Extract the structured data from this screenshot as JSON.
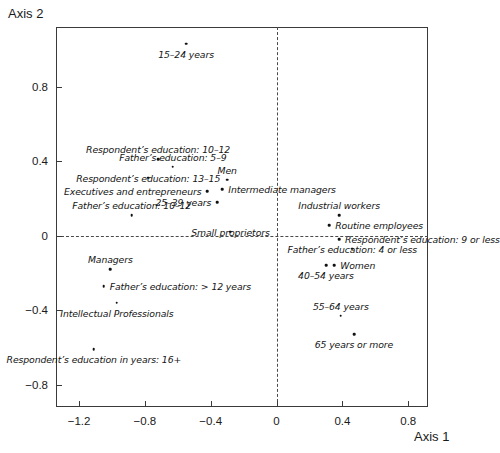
{
  "chart_data": {
    "type": "scatter",
    "title": "",
    "xlabel": "Axis 1",
    "ylabel": "Axis 2",
    "xlim": [
      -1.34,
      0.92
    ],
    "ylim": [
      -0.92,
      1.12
    ],
    "grid": false,
    "legend": "none",
    "zero_lines": true,
    "xticks": [
      -1.2,
      -0.8,
      -0.4,
      0,
      0.4,
      0.8
    ],
    "xticklabels": [
      "−1.2",
      "−0.8",
      "−0.4",
      "0",
      "0.4",
      "0.8"
    ],
    "yticks": [
      0.8,
      0.4,
      0,
      -0.4,
      -0.8
    ],
    "yticklabels": [
      "0.8",
      "0.4",
      "0",
      "−0.4",
      "−0.8"
    ],
    "points": [
      {
        "label": "15–24 years",
        "x": -0.55,
        "y": 1.03,
        "label_pos": "below",
        "label_anchor": "middle"
      },
      {
        "label": "Respondent’s education: 10–12",
        "x": -0.72,
        "y": 0.41,
        "label_pos": "above",
        "label_anchor": "middle"
      },
      {
        "label": "Father’s education: 5–9",
        "x": -0.63,
        "y": 0.37,
        "label_pos": "above",
        "label_anchor": "middle"
      },
      {
        "label": "Respondent’s education: 13–15",
        "x": -0.78,
        "y": 0.31,
        "label_pos": "center",
        "label_anchor": "middle"
      },
      {
        "label": "Men",
        "x": -0.3,
        "y": 0.3,
        "label_pos": "above",
        "label_anchor": "middle"
      },
      {
        "label": "Intermediate managers",
        "x": -0.33,
        "y": 0.25,
        "label_pos": "right",
        "label_anchor": "start"
      },
      {
        "label": "Executives and entrepreneurs",
        "x": -0.42,
        "y": 0.24,
        "label_pos": "left",
        "label_anchor": "end"
      },
      {
        "label": "25–39 years",
        "x": -0.36,
        "y": 0.18,
        "label_pos": "left",
        "label_anchor": "end"
      },
      {
        "label": "Father’s education: 10–12",
        "x": -0.88,
        "y": 0.11,
        "label_pos": "above",
        "label_anchor": "middle"
      },
      {
        "label": "Small proprietors",
        "x": -0.28,
        "y": 0.02,
        "label_pos": "center",
        "label_anchor": "middle"
      },
      {
        "label": "Industrial workers",
        "x": 0.38,
        "y": 0.11,
        "label_pos": "above",
        "label_anchor": "middle"
      },
      {
        "label": "Routine employees",
        "x": 0.32,
        "y": 0.055,
        "label_pos": "right",
        "label_anchor": "start"
      },
      {
        "label": "Respondent’s education: 9 or less",
        "x": 0.38,
        "y": -0.02,
        "label_pos": "right",
        "label_anchor": "start"
      },
      {
        "label": "Father’s education: 4 or less",
        "x": 0.46,
        "y": -0.07,
        "label_pos": "center",
        "label_anchor": "middle"
      },
      {
        "label": "Women",
        "x": 0.35,
        "y": -0.16,
        "label_pos": "right",
        "label_anchor": "start"
      },
      {
        "label": "40–54 years",
        "x": 0.3,
        "y": -0.16,
        "label_pos": "below",
        "label_anchor": "middle"
      },
      {
        "label": "55–64 years",
        "x": 0.39,
        "y": -0.43,
        "label_pos": "above",
        "label_anchor": "middle"
      },
      {
        "label": "65 years or more",
        "x": 0.47,
        "y": -0.53,
        "label_pos": "below",
        "label_anchor": "middle"
      },
      {
        "label": "Managers",
        "x": -1.01,
        "y": -0.18,
        "label_pos": "above",
        "label_anchor": "middle"
      },
      {
        "label": "Father’s education: > 12 years",
        "x": -1.05,
        "y": -0.27,
        "label_pos": "right",
        "label_anchor": "start"
      },
      {
        "label": "Intellectual Professionals",
        "x": -0.97,
        "y": -0.36,
        "label_pos": "below",
        "label_anchor": "middle"
      },
      {
        "label": "Respondent’s education in years: 16+",
        "x": -1.11,
        "y": -0.61,
        "label_pos": "below",
        "label_anchor": "middle"
      }
    ]
  }
}
